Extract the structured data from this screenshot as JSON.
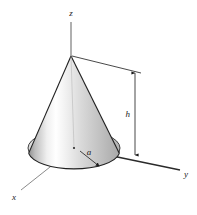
{
  "figure": {
    "type": "geometry-diagram",
    "background_color": "#ffffff",
    "outline_color": "#1a1a1a",
    "axes": [
      {
        "id": "z",
        "label": "z",
        "label_x": 71,
        "label_y": 15,
        "direction": "up",
        "line": {
          "x1": 71,
          "y1": 22,
          "x2": 71,
          "y2": 56
        }
      },
      {
        "id": "y",
        "label": "y",
        "label_x": 186,
        "label_y": 175,
        "direction": "down-right",
        "line": {
          "x1": 74,
          "y1": 148,
          "x2": 180,
          "y2": 170
        }
      },
      {
        "id": "x",
        "label": "x",
        "label_x": 14,
        "label_y": 199,
        "direction": "down-left",
        "line": {
          "x1": 74,
          "y1": 148,
          "x2": 21,
          "y2": 190
        }
      }
    ],
    "cone": {
      "apex": {
        "x": 71,
        "y": 56
      },
      "base_center": {
        "x": 74,
        "y": 148
      },
      "base_rx": 46,
      "base_ry": 17,
      "left_base": {
        "x": 44,
        "y": 167
      },
      "right_base": {
        "x": 135,
        "y": 155
      },
      "fill_light": "#ffffff",
      "fill_mid": "#d6d6d6",
      "fill_dark": "#9b9b9b"
    },
    "dimensions": [
      {
        "id": "height",
        "label": "h",
        "label_x": 130,
        "label_y": 116,
        "line": {
          "x1": 135,
          "y1": 72,
          "x2": 135,
          "y2": 155
        },
        "arrows": "both",
        "extension_top": {
          "x1": 72,
          "y1": 56,
          "x2": 139,
          "y2": 73
        },
        "extension_bottom": {
          "x1": 135,
          "y1": 155,
          "x2": 180,
          "y2": 170
        }
      },
      {
        "id": "radius",
        "label": "a",
        "label_x": 89,
        "label_y": 155,
        "line": {
          "x1": 80,
          "y1": 152,
          "x2": 101,
          "y2": 168
        },
        "arrows": "end"
      }
    ],
    "base_spokes": [
      {
        "x1": 74,
        "y1": 148,
        "x2": 44,
        "y2": 167
      },
      {
        "x1": 74,
        "y1": 148,
        "x2": 135,
        "y2": 155
      },
      {
        "x1": 74,
        "y1": 148,
        "x2": 63,
        "y2": 172
      }
    ]
  }
}
